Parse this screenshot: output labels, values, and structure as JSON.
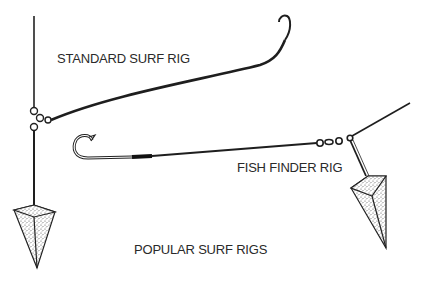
{
  "figure": {
    "caption": "POPULAR SURF RIGS",
    "colors": {
      "ink": "#1e1e1e",
      "background": "#ffffff",
      "stipple": "#555555"
    }
  },
  "rigs": [
    {
      "id": "standard",
      "label": "STANDARD SURF RIG",
      "parts": [
        "main-line",
        "three-way-swivel",
        "leader",
        "hook",
        "pyramid-sinker"
      ]
    },
    {
      "id": "fish-finder",
      "label": "FISH FINDER RIG",
      "parts": [
        "main-line",
        "barrel-swivel",
        "leader",
        "hook",
        "sinker-slide",
        "pyramid-sinker"
      ]
    }
  ]
}
